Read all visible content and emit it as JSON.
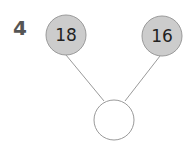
{
  "question_number": "4",
  "diagram": {
    "type": "number-bond",
    "parts": [
      {
        "id": "left",
        "value": "18",
        "cx": 66,
        "cy": 35,
        "r": 20
      },
      {
        "id": "right",
        "value": "16",
        "cx": 162,
        "cy": 36,
        "r": 20
      }
    ],
    "whole": {
      "id": "bottom",
      "value": "",
      "cx": 114,
      "cy": 120,
      "r": 20
    },
    "colors": {
      "part_fill": "#cccccc",
      "part_stroke": "#9a9a9a",
      "whole_fill": "#ffffff",
      "whole_stroke": "#9a9a9a",
      "line": "#9a9a9a",
      "label": "#555555"
    }
  }
}
